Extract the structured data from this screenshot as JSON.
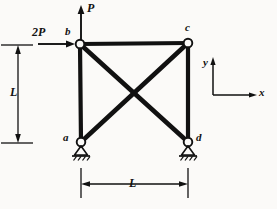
{
  "figure": {
    "background_color": "#fbfaf8",
    "line_color": "#111111"
  },
  "nodes": [
    {
      "id": "b",
      "label": "b",
      "x": 80,
      "y": 44,
      "label_x": 66,
      "label_y": 30
    },
    {
      "id": "c",
      "label": "c",
      "x": 188,
      "y": 43,
      "label_x": 186,
      "label_y": 25
    },
    {
      "id": "a",
      "label": "a",
      "x": 81,
      "y": 142,
      "label_x": 64,
      "label_y": 134
    },
    {
      "id": "d",
      "label": "d",
      "x": 188,
      "y": 142,
      "label_x": 197,
      "label_y": 134
    }
  ],
  "members": [
    {
      "name": "top-chord-bc",
      "from": "b",
      "to": "c"
    },
    {
      "name": "left-chord-ab",
      "from": "a",
      "to": "b"
    },
    {
      "name": "right-chord-cd",
      "from": "c",
      "to": "d"
    },
    {
      "name": "diagonal-bd",
      "from": "b",
      "to": "d"
    },
    {
      "name": "diagonal-ac",
      "from": "a",
      "to": "c"
    }
  ],
  "supports": [
    {
      "name": "pin-support-a",
      "node": "a"
    },
    {
      "name": "pin-support-d",
      "node": "d"
    }
  ],
  "forces": [
    {
      "name": "vertical-load-P",
      "label": "P",
      "direction": "up",
      "applied_at": "b"
    },
    {
      "name": "horizontal-load-2P",
      "label": "2P",
      "direction": "right",
      "applied_at": "b"
    }
  ],
  "dimensions": [
    {
      "name": "vertical-dimension",
      "label": "L",
      "orientation": "vertical",
      "label_x": 14,
      "label_y": 85
    },
    {
      "name": "horizontal-dimension",
      "label": "L",
      "orientation": "horizontal",
      "label_x": 130,
      "label_y": 180
    }
  ],
  "axes": {
    "name": "coordinate-axes",
    "x_label": "x",
    "y_label": "y",
    "origin_x": 213,
    "origin_y": 95
  },
  "labels": {
    "force_P": "P",
    "force_2P": "2P",
    "dimension_L_vertical": "L",
    "dimension_L_horizontal": "L",
    "axis_x": "x",
    "axis_y": "y",
    "node_a": "a",
    "node_b": "b",
    "node_c": "c",
    "node_d": "d"
  }
}
